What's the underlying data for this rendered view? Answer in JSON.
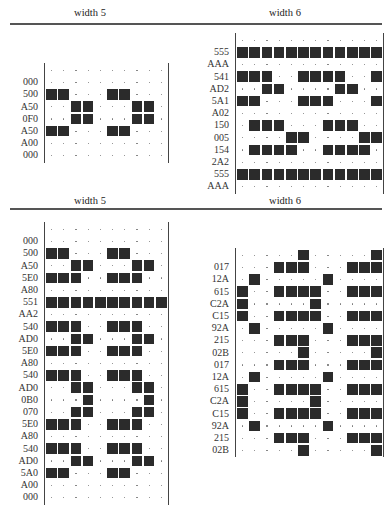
{
  "headers": {
    "top": {
      "left": "width 5",
      "right": "width 6"
    },
    "bottom": {
      "left": "width 5",
      "right": "width 6"
    }
  },
  "grids": {
    "top_left": {
      "cols": 10,
      "rows": [
        {
          "label": "",
          "filled": []
        },
        {
          "label": "000",
          "filled": []
        },
        {
          "label": "500",
          "filled": [
            0,
            1,
            5,
            6
          ]
        },
        {
          "label": "A50",
          "filled": [
            2,
            3,
            7,
            8
          ]
        },
        {
          "label": "0F0",
          "filled": [
            2,
            3,
            7,
            8
          ]
        },
        {
          "label": "A50",
          "filled": [
            0,
            1,
            5,
            6
          ]
        },
        {
          "label": "A00",
          "filled": []
        },
        {
          "label": "000",
          "filled": []
        }
      ]
    },
    "top_right": {
      "cols": 12,
      "rows": [
        {
          "label": "",
          "filled": []
        },
        {
          "label": "555",
          "filled": [
            0,
            1,
            2,
            3,
            4,
            5,
            6,
            7,
            8,
            9,
            10,
            11
          ]
        },
        {
          "label": "AAA",
          "filled": []
        },
        {
          "label": "541",
          "filled": [
            0,
            1,
            2,
            5,
            6,
            7,
            8,
            11
          ]
        },
        {
          "label": "AD2",
          "filled": [
            2,
            3,
            8,
            9
          ]
        },
        {
          "label": "5A1",
          "filled": [
            0,
            1,
            5,
            6,
            7,
            11
          ]
        },
        {
          "label": "A02",
          "filled": []
        },
        {
          "label": "150",
          "filled": [
            1,
            2,
            3,
            7,
            8,
            9
          ]
        },
        {
          "label": "005",
          "filled": [
            4,
            5,
            10,
            11
          ]
        },
        {
          "label": "154",
          "filled": [
            1,
            2,
            3,
            4,
            7,
            8,
            9,
            10
          ]
        },
        {
          "label": "2A2",
          "filled": []
        },
        {
          "label": "555",
          "filled": [
            0,
            1,
            2,
            3,
            4,
            5,
            6,
            7,
            8,
            9,
            10,
            11
          ]
        },
        {
          "label": "AAA",
          "filled": []
        }
      ]
    },
    "bottom_left": {
      "cols": 10,
      "rows": [
        {
          "label": "",
          "filled": []
        },
        {
          "label": "000",
          "filled": []
        },
        {
          "label": "500",
          "filled": [
            0,
            1,
            5,
            6
          ]
        },
        {
          "label": "A50",
          "filled": [
            2,
            3,
            7,
            8
          ]
        },
        {
          "label": "5E0",
          "filled": [
            0,
            1,
            2,
            5,
            6,
            7
          ]
        },
        {
          "label": "A80",
          "filled": []
        },
        {
          "label": "551",
          "filled": [
            0,
            1,
            2,
            3,
            4,
            5,
            6,
            7,
            8,
            9
          ]
        },
        {
          "label": "AA2",
          "filled": []
        },
        {
          "label": "540",
          "filled": [
            0,
            1,
            2,
            5,
            6,
            7
          ]
        },
        {
          "label": "AD0",
          "filled": [
            2,
            3,
            7,
            8
          ]
        },
        {
          "label": "5E0",
          "filled": [
            0,
            1,
            2,
            5,
            6,
            7
          ]
        },
        {
          "label": "A80",
          "filled": []
        },
        {
          "label": "540",
          "filled": [
            0,
            1,
            2,
            5,
            6,
            7
          ]
        },
        {
          "label": "AD0",
          "filled": [
            2,
            3,
            7,
            8
          ]
        },
        {
          "label": "0B0",
          "filled": [
            3,
            8
          ]
        },
        {
          "label": "070",
          "filled": [
            2,
            3,
            7,
            8
          ]
        },
        {
          "label": "5E0",
          "filled": [
            0,
            1,
            2,
            5,
            6,
            7
          ]
        },
        {
          "label": "A80",
          "filled": []
        },
        {
          "label": "540",
          "filled": [
            0,
            1,
            2,
            5,
            6,
            7
          ]
        },
        {
          "label": "AD0",
          "filled": [
            2,
            3,
            7,
            8
          ]
        },
        {
          "label": "5A0",
          "filled": [
            0,
            1,
            5,
            6
          ]
        },
        {
          "label": "A00",
          "filled": []
        },
        {
          "label": "000",
          "filled": []
        }
      ]
    },
    "bottom_right": {
      "cols": 12,
      "rows": [
        {
          "label": "",
          "filled": [
            5,
            11
          ]
        },
        {
          "label": "017",
          "filled": [
            3,
            4,
            5,
            9,
            10,
            11
          ]
        },
        {
          "label": "12A",
          "filled": [
            1,
            7
          ]
        },
        {
          "label": "615",
          "filled": [
            0,
            3,
            4,
            5,
            6,
            9,
            10,
            11
          ]
        },
        {
          "label": "C2A",
          "filled": [
            0,
            6
          ]
        },
        {
          "label": "C15",
          "filled": [
            0,
            3,
            4,
            5,
            6,
            9,
            10,
            11
          ]
        },
        {
          "label": "92A",
          "filled": [
            1,
            7
          ]
        },
        {
          "label": "215",
          "filled": [
            3,
            4,
            5,
            9,
            10,
            11
          ]
        },
        {
          "label": "02B",
          "filled": [
            5,
            11
          ]
        },
        {
          "label": "017",
          "filled": [
            3,
            4,
            5,
            9,
            10,
            11
          ]
        },
        {
          "label": "12A",
          "filled": [
            1,
            7
          ]
        },
        {
          "label": "615",
          "filled": [
            0,
            3,
            4,
            5,
            6,
            9,
            10,
            11
          ]
        },
        {
          "label": "C2A",
          "filled": [
            0,
            6
          ]
        },
        {
          "label": "C15",
          "filled": [
            0,
            3,
            4,
            5,
            6,
            9,
            10,
            11
          ]
        },
        {
          "label": "92A",
          "filled": [
            1,
            7
          ]
        },
        {
          "label": "215",
          "filled": [
            3,
            4,
            5,
            9,
            10,
            11
          ]
        },
        {
          "label": "02B",
          "filled": [
            5,
            11
          ]
        }
      ]
    }
  }
}
